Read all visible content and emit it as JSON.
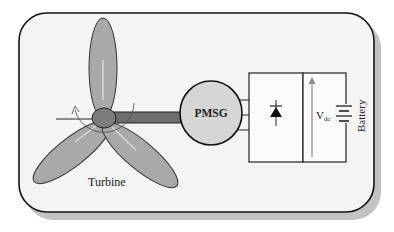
{
  "diagram": {
    "type": "wind-energy-conversion-system",
    "components": {
      "turbine": {
        "label": "Turbine"
      },
      "generator": {
        "label": "PMSG"
      },
      "rectifier": {
        "symbol": "diode"
      },
      "dc_link": {
        "label_main": "V",
        "label_sub": "dc"
      },
      "battery": {
        "label": "Battery"
      }
    },
    "colors": {
      "frame_fill": "#f4f4f4",
      "frame_stroke": "#111111",
      "shadow": "#bdbdbd",
      "blade_fill": "#a9a9a9",
      "hub_fill": "#7c7c7c",
      "shaft_fill": "#6e6e6e",
      "generator_fill": "#d6d6d6",
      "line": "#222222",
      "arrow": "#8a8a8a"
    }
  }
}
